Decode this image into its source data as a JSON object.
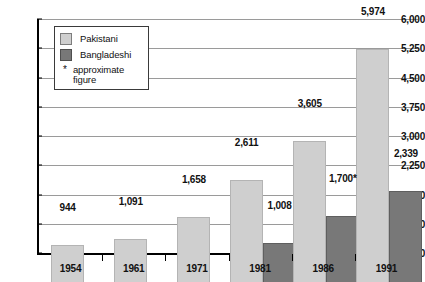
{
  "chart_data": {
    "type": "bar",
    "title": "",
    "subtitle": "",
    "xlabel": "",
    "ylabel": "",
    "categories": [
      "1954",
      "1961",
      "1971",
      "1981",
      "1986",
      "1991"
    ],
    "series": [
      {
        "name": "Pakistani",
        "color": "#cfcfcf",
        "values": [
          944,
          1091,
          1658,
          2611,
          3605,
          5974
        ],
        "labels": [
          "944",
          "1,091",
          "1,658",
          "2,611",
          "3,605",
          "5,974"
        ]
      },
      {
        "name": "Bangladeshi",
        "color": "#787878",
        "values": [
          null,
          null,
          null,
          1008,
          1700,
          2339
        ],
        "labels": [
          "",
          "",
          "",
          "1,008",
          "1,700*",
          "2,339"
        ]
      }
    ],
    "ylim": [
      0,
      6000
    ],
    "yticks": [
      0,
      750,
      1500,
      2250,
      3000,
      3750,
      4500,
      5250,
      6000
    ],
    "ytick_labels": [
      "0",
      "750",
      "1,500",
      "2,250",
      "3,000",
      "3,750",
      "4,500",
      "5,250",
      "6,000"
    ],
    "grid": true,
    "legend_position": "top-left",
    "annotations": [
      "* approximate figure"
    ]
  },
  "legend": {
    "items": [
      {
        "label": "Pakistani",
        "swatch": "pakistani"
      },
      {
        "label": "Bangladeshi",
        "swatch": "bangladeshi"
      }
    ],
    "note_star": "*",
    "note_text": "approximate figure"
  }
}
